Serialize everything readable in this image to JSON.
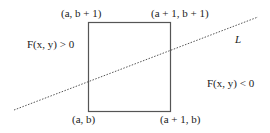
{
  "diagram": {
    "square": {
      "corners": {
        "top_left": "(a, b + 1)",
        "top_right": "(a + 1, b + 1)",
        "bottom_left": "(a, b)",
        "bottom_right": "(a + 1, b)"
      },
      "stroke_color": "#555555"
    },
    "line": {
      "label": "L",
      "style": "dotted",
      "color": "#555555"
    },
    "regions": {
      "above": "F(x, y) > 0",
      "below": "F(x, y) < 0"
    }
  }
}
